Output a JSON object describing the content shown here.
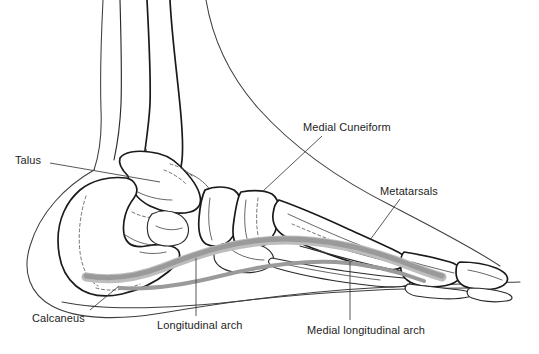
{
  "diagram": {
    "type": "anatomical-illustration",
    "width": 539,
    "height": 354,
    "background_color": "#ffffff"
  },
  "colors": {
    "outline": "#1a1a1a",
    "detail": "#4a4a4a",
    "skin_outline": "#3d3d3d",
    "arch_band": "#9a9a9a",
    "arch_band_light": "#bdbdbd",
    "label_text": "#1d1d1d",
    "leader_line": "#3a3a3a"
  },
  "labels": [
    {
      "id": "talus",
      "text": "Talus",
      "x": 15,
      "y": 155,
      "leader": {
        "x1": 50,
        "y1": 163,
        "x2": 160,
        "y2": 182
      }
    },
    {
      "id": "calcaneus",
      "text": "Calcaneus",
      "x": 32,
      "y": 313,
      "leader": {
        "x1": 90,
        "y1": 310,
        "x2": 119,
        "y2": 286
      }
    },
    {
      "id": "medial-cuneiform",
      "text": "Medial Cuneiform",
      "x": 303,
      "y": 122,
      "leader": {
        "x1": 322,
        "y1": 136,
        "x2": 262,
        "y2": 192
      }
    },
    {
      "id": "metatarsals",
      "text": "Metatarsals",
      "x": 380,
      "y": 186,
      "leader": {
        "x1": 400,
        "y1": 199,
        "x2": 370,
        "y2": 240
      }
    },
    {
      "id": "longitudinal-arch",
      "text": "Longitudinal arch",
      "x": 157,
      "y": 320,
      "leader": {
        "x1": 196,
        "y1": 258,
        "x2": 196,
        "y2": 316
      }
    },
    {
      "id": "medial-longitudinal-arch",
      "text": "Medial longitudinal arch",
      "x": 307,
      "y": 325,
      "leader": {
        "x1": 350,
        "y1": 262,
        "x2": 350,
        "y2": 320
      }
    }
  ],
  "structures": [
    {
      "id": "tibia",
      "name": "Tibia (shin bone)"
    },
    {
      "id": "fibula",
      "name": "Fibula"
    },
    {
      "id": "talus-bone",
      "name": "Talus"
    },
    {
      "id": "calcaneus-bone",
      "name": "Calcaneus (heel bone)"
    },
    {
      "id": "navicular-bone",
      "name": "Navicular"
    },
    {
      "id": "cuboid-bone",
      "name": "Cuboid"
    },
    {
      "id": "cuneiform-bones",
      "name": "Cuneiform bones"
    },
    {
      "id": "metatarsal-bones",
      "name": "Metatarsals"
    },
    {
      "id": "phalanges-bones",
      "name": "Phalanges (toes)"
    },
    {
      "id": "arch-band-shape",
      "name": "Longitudinal arch highlight band"
    },
    {
      "id": "skin-contour",
      "name": "Soft tissue / skin contour"
    }
  ]
}
